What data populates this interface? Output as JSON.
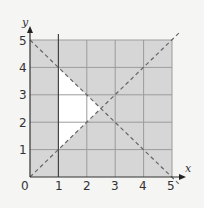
{
  "diagram": {
    "type": "linear-inequality-region",
    "x_axis_label": "x",
    "y_axis_label": "y",
    "origin_label": "0",
    "x_ticks": [
      "1",
      "2",
      "3",
      "4",
      "5"
    ],
    "y_ticks": [
      "1",
      "2",
      "3",
      "4",
      "5"
    ],
    "range": {
      "x": [
        0,
        5
      ],
      "y": [
        0,
        5
      ]
    },
    "lines": [
      {
        "name": "x = 1",
        "style": "solid"
      },
      {
        "name": "y = x",
        "style": "dashed"
      },
      {
        "name": "x + y = 5",
        "style": "dashed"
      }
    ],
    "unshaded_region_vertices": [
      [
        1,
        1
      ],
      [
        1,
        4
      ],
      [
        2.5,
        2.5
      ]
    ],
    "colors": {
      "shaded": "#d6d6d6",
      "grid": "#9c9c9c",
      "axis": "#333333",
      "dashed": "#666666",
      "background": "#f5f5f3",
      "region": "#ffffff"
    }
  }
}
